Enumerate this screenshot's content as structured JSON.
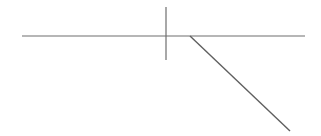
{
  "figure": {
    "background_color": "#ffffff",
    "width": 321,
    "height": 136,
    "stroke_color": "#6e6e6e",
    "segments": [
      {
        "name": "horizontal-baseline",
        "label": "Horizontal baseline",
        "x1": 22,
        "y1": 36,
        "x2": 305,
        "y2": 36,
        "stroke_width": 1.2,
        "color": "#6e6e6e"
      },
      {
        "name": "vertical-tick",
        "label": "Vertical tick mark",
        "x1": 166,
        "y1": 7,
        "x2": 166,
        "y2": 60,
        "stroke_width": 1.2,
        "color": "#6e6e6e"
      },
      {
        "name": "diagonal-branch",
        "label": "Diagonal descending branch",
        "x1": 190,
        "y1": 36,
        "x2": 290,
        "y2": 131,
        "stroke_width": 1.4,
        "color": "#5f5f5f"
      }
    ],
    "junction": {
      "name": "branch-junction",
      "label": "Branch junction point",
      "x": 190,
      "y": 36
    },
    "crossing": {
      "name": "tick-crossing",
      "label": "Tick crossing point",
      "x": 166,
      "y": 36
    }
  }
}
